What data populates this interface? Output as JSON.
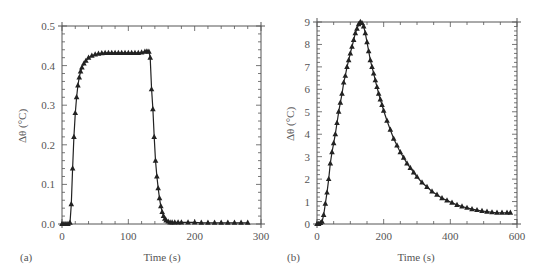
{
  "chart_data": [
    {
      "panel": "(a)",
      "type": "line",
      "marker": "triangle",
      "title": "",
      "xlabel": "Time (s)",
      "ylabel": "Δθ (°C)",
      "xlim": [
        0,
        300
      ],
      "ylim": [
        0,
        0.5
      ],
      "xticks": [
        0,
        100,
        200,
        300
      ],
      "xtick_labels": [
        "0",
        "100",
        "200",
        "300"
      ],
      "yticks": [
        0.0,
        0.1,
        0.2,
        0.3,
        0.4,
        0.5
      ],
      "ytick_labels": [
        "0.0",
        "0.1",
        "0.2",
        "0.3",
        "0.4",
        "0.5"
      ],
      "grid": false,
      "series": [
        {
          "name": "Δθ",
          "x": [
            0,
            3,
            6,
            9,
            12,
            14,
            16,
            18,
            20,
            22,
            24,
            26,
            28,
            30,
            33,
            36,
            40,
            45,
            50,
            55,
            60,
            65,
            70,
            75,
            80,
            85,
            90,
            95,
            100,
            105,
            110,
            115,
            120,
            125,
            128,
            131,
            133,
            135,
            137,
            139,
            141,
            143,
            145,
            147,
            149,
            151,
            153,
            155,
            157,
            160,
            163,
            166,
            170,
            175,
            180,
            190,
            200,
            210,
            220,
            230,
            240,
            250,
            260,
            270,
            280
          ],
          "values": [
            0,
            0,
            0,
            0,
            0.003,
            0.05,
            0.14,
            0.22,
            0.28,
            0.32,
            0.35,
            0.37,
            0.385,
            0.395,
            0.405,
            0.412,
            0.42,
            0.425,
            0.428,
            0.43,
            0.431,
            0.432,
            0.432,
            0.432,
            0.432,
            0.432,
            0.432,
            0.432,
            0.432,
            0.432,
            0.432,
            0.432,
            0.433,
            0.435,
            0.436,
            0.435,
            0.42,
            0.34,
            0.29,
            0.22,
            0.16,
            0.12,
            0.09,
            0.065,
            0.045,
            0.03,
            0.02,
            0.013,
            0.009,
            0.006,
            0.004,
            0.004,
            0.004,
            0.004,
            0.004,
            0.004,
            0.004,
            0.003,
            0.003,
            0.003,
            0.003,
            0.003,
            0.003,
            0.003,
            0.003
          ]
        }
      ]
    },
    {
      "panel": "(b)",
      "type": "line",
      "marker": "triangle",
      "title": "",
      "xlabel": "Time (s)",
      "ylabel": "Δθ (°C)",
      "xlim": [
        0,
        600
      ],
      "ylim": [
        0,
        9
      ],
      "xticks": [
        0,
        200,
        400,
        600
      ],
      "xtick_labels": [
        "0",
        "200",
        "400",
        "600"
      ],
      "yticks": [
        0,
        1,
        2,
        3,
        4,
        5,
        6,
        7,
        8,
        9
      ],
      "ytick_labels": [
        "0",
        "1",
        "2",
        "3",
        "4",
        "5",
        "6",
        "7",
        "8",
        "9"
      ],
      "grid": false,
      "series": [
        {
          "name": "Δθ",
          "x": [
            0,
            5,
            10,
            15,
            20,
            25,
            30,
            35,
            40,
            45,
            50,
            55,
            60,
            65,
            70,
            75,
            80,
            85,
            90,
            95,
            100,
            105,
            110,
            115,
            120,
            125,
            130,
            135,
            140,
            145,
            150,
            155,
            160,
            165,
            170,
            175,
            180,
            185,
            190,
            195,
            200,
            210,
            220,
            230,
            240,
            250,
            260,
            270,
            280,
            290,
            300,
            315,
            330,
            345,
            360,
            375,
            390,
            405,
            420,
            435,
            450,
            465,
            480,
            495,
            510,
            525,
            540,
            555,
            570,
            580
          ],
          "values": [
            0,
            0,
            0.05,
            0.1,
            0.4,
            0.9,
            1.4,
            2.0,
            2.7,
            3.2,
            3.6,
            4.0,
            4.5,
            5.0,
            5.4,
            5.8,
            6.3,
            6.6,
            7.0,
            7.3,
            7.6,
            7.9,
            8.2,
            8.5,
            8.7,
            8.9,
            9.0,
            8.95,
            8.8,
            8.5,
            8.1,
            7.7,
            7.3,
            7.0,
            6.7,
            6.4,
            6.1,
            5.8,
            5.55,
            5.3,
            5.05,
            4.6,
            4.2,
            3.8,
            3.5,
            3.2,
            2.95,
            2.7,
            2.5,
            2.3,
            2.1,
            1.85,
            1.65,
            1.45,
            1.3,
            1.15,
            1.05,
            0.95,
            0.85,
            0.78,
            0.72,
            0.66,
            0.62,
            0.58,
            0.55,
            0.52,
            0.5,
            0.5,
            0.5,
            0.5
          ]
        }
      ]
    }
  ],
  "panels": [
    {
      "label": "(a)",
      "xlabel": "Time (s)",
      "ylabel": "Δθ (°C)"
    },
    {
      "label": "(b)",
      "xlabel": "Time (s)",
      "ylabel": "Δθ (°C)"
    }
  ],
  "colors": {
    "axis": "#555555",
    "series": "#222222",
    "text": "#555555"
  }
}
